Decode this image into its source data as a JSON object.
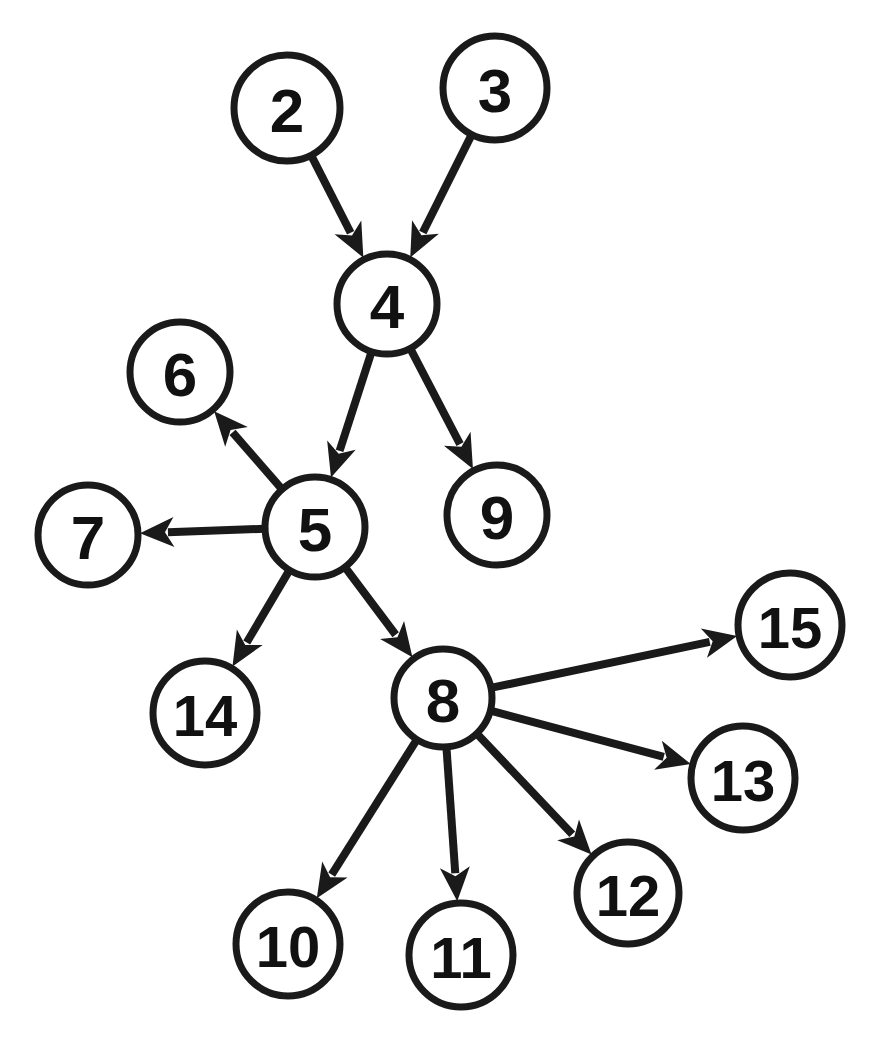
{
  "diagram": {
    "type": "directed-graph",
    "background_color": "#ffffff",
    "node_fill_color": "#ffffff",
    "node_stroke_color": "#1a1a1a",
    "edge_color": "#1a1a1a",
    "label_color": "#111111",
    "canvas": {
      "width": 882,
      "height": 1053
    },
    "nodes": [
      {
        "id": "2",
        "label": "2",
        "cx": 287,
        "cy": 108,
        "r": 53,
        "font_size": 62
      },
      {
        "id": "3",
        "label": "3",
        "cx": 495,
        "cy": 88,
        "r": 52,
        "font_size": 62
      },
      {
        "id": "4",
        "label": "4",
        "cx": 387,
        "cy": 304,
        "r": 50,
        "font_size": 62
      },
      {
        "id": "6",
        "label": "6",
        "cx": 180,
        "cy": 372,
        "r": 50,
        "font_size": 62
      },
      {
        "id": "5",
        "label": "5",
        "cx": 315,
        "cy": 527,
        "r": 50,
        "font_size": 62
      },
      {
        "id": "7",
        "label": "7",
        "cx": 88,
        "cy": 535,
        "r": 50,
        "font_size": 62
      },
      {
        "id": "9",
        "label": "9",
        "cx": 497,
        "cy": 515,
        "r": 50,
        "font_size": 62
      },
      {
        "id": "15",
        "label": "15",
        "cx": 790,
        "cy": 625,
        "r": 52,
        "font_size": 58
      },
      {
        "id": "8",
        "label": "8",
        "cx": 443,
        "cy": 698,
        "r": 49,
        "font_size": 62
      },
      {
        "id": "14",
        "label": "14",
        "cx": 205,
        "cy": 713,
        "r": 52,
        "font_size": 58
      },
      {
        "id": "13",
        "label": "13",
        "cx": 743,
        "cy": 778,
        "r": 52,
        "font_size": 58
      },
      {
        "id": "12",
        "label": "12",
        "cx": 628,
        "cy": 893,
        "r": 51,
        "font_size": 58
      },
      {
        "id": "10",
        "label": "10",
        "cx": 288,
        "cy": 944,
        "r": 52,
        "font_size": 58
      },
      {
        "id": "11",
        "label": "11",
        "cx": 461,
        "cy": 955,
        "r": 52,
        "font_size": 58
      }
    ],
    "edges": [
      {
        "from": "2",
        "to": "4",
        "directed": true
      },
      {
        "from": "3",
        "to": "4",
        "directed": true
      },
      {
        "from": "4",
        "to": "5",
        "directed": true
      },
      {
        "from": "4",
        "to": "9",
        "directed": true
      },
      {
        "from": "5",
        "to": "6",
        "directed": true
      },
      {
        "from": "5",
        "to": "7",
        "directed": true
      },
      {
        "from": "5",
        "to": "14",
        "directed": true
      },
      {
        "from": "5",
        "to": "8",
        "directed": true
      },
      {
        "from": "8",
        "to": "15",
        "directed": true
      },
      {
        "from": "8",
        "to": "13",
        "directed": true
      },
      {
        "from": "8",
        "to": "12",
        "directed": true
      },
      {
        "from": "8",
        "to": "11",
        "directed": true
      },
      {
        "from": "8",
        "to": "10",
        "directed": true
      }
    ]
  }
}
